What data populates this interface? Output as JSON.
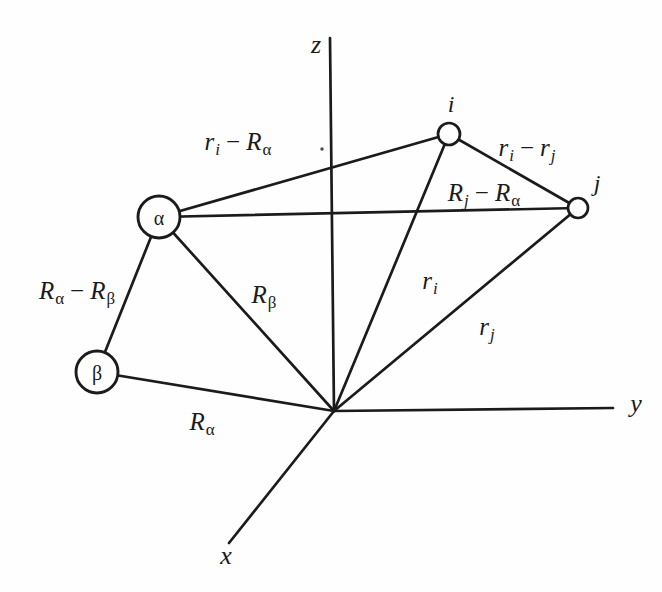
{
  "figure": {
    "axes": {
      "x": "x",
      "y": "y",
      "z": "z"
    },
    "nodes": {
      "alpha": "α",
      "beta": "β",
      "i": "i",
      "j": "j"
    },
    "vector_labels": {
      "ri_minus_Ralpha": {
        "b1": "r",
        "s1": "i",
        "op": "−",
        "b2": "R",
        "s2": "α"
      },
      "ri_minus_rj": {
        "b1": "r",
        "s1": "i",
        "op": "−",
        "b2": "r",
        "s2": "j"
      },
      "Rj_minus_Ralpha": {
        "b1": "R",
        "s1": "j",
        "op": "−",
        "b2": "R",
        "s2": "α"
      },
      "Ralpha_minus_Rbeta": {
        "b1": "R",
        "s1": "α",
        "op": "−",
        "b2": "R",
        "s2": "β"
      },
      "Rbeta": {
        "b1": "R",
        "s1": "β"
      },
      "Ralpha": {
        "b1": "R",
        "s1": "α"
      },
      "ri": {
        "b1": "r",
        "s1": "i"
      },
      "rj": {
        "b1": "r",
        "s1": "j"
      }
    }
  },
  "colors": {
    "ink": "#1b1b1b",
    "background": "#fefefe"
  }
}
